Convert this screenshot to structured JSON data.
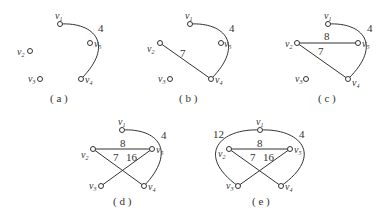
{
  "panels": [
    {
      "caption": "( a )",
      "nodes": {
        "v1": [
          60,
          24
        ],
        "v2": [
          30,
          51
        ],
        "v3": [
          40,
          79
        ],
        "v4": [
          81,
          79
        ],
        "v5": [
          90,
          43
        ]
      },
      "edges": [
        {
          "from": "v1",
          "to": "v4",
          "weight": "4",
          "curved": true
        }
      ]
    },
    {
      "caption": "( b )",
      "nodes": {
        "v1": [
          190,
          24
        ],
        "v2": [
          160,
          43
        ],
        "v3": [
          170,
          79
        ],
        "v4": [
          211,
          79
        ],
        "v5": [
          221,
          43
        ]
      },
      "edges": [
        {
          "from": "v1",
          "to": "v4",
          "weight": "4",
          "curved": true
        },
        {
          "from": "v2",
          "to": "v4",
          "weight": "7"
        }
      ]
    },
    {
      "caption": "( c )",
      "nodes": {
        "v1": [
          328,
          24
        ],
        "v2": [
          297,
          43
        ],
        "v3": [
          306,
          79
        ],
        "v4": [
          348,
          79
        ],
        "v5": [
          358,
          43
        ]
      },
      "edges": [
        {
          "from": "v1",
          "to": "v4",
          "weight": "4",
          "curved": true
        },
        {
          "from": "v2",
          "to": "v4",
          "weight": "7"
        },
        {
          "from": "v2",
          "to": "v5",
          "weight": "8"
        }
      ]
    },
    {
      "caption": "( d )",
      "nodes": {
        "v1": [
          122,
          130
        ],
        "v2": [
          93,
          149
        ],
        "v3": [
          101,
          186
        ],
        "v4": [
          144,
          186
        ],
        "v5": [
          152,
          149
        ]
      },
      "edges": [
        {
          "from": "v1",
          "to": "v4",
          "weight": "4",
          "curved": true
        },
        {
          "from": "v2",
          "to": "v4",
          "weight": "7"
        },
        {
          "from": "v2",
          "to": "v5",
          "weight": "8"
        },
        {
          "from": "v5",
          "to": "v3",
          "weight": "16"
        }
      ]
    },
    {
      "caption": "( e )",
      "nodes": {
        "v1": [
          260,
          130
        ],
        "v2": [
          229,
          149
        ],
        "v3": [
          238,
          186
        ],
        "v4": [
          281,
          186
        ],
        "v5": [
          290,
          149
        ]
      },
      "edges": [
        {
          "from": "v1",
          "to": "v4",
          "weight": "4",
          "curved": true
        },
        {
          "from": "v2",
          "to": "v4",
          "weight": "7"
        },
        {
          "from": "v2",
          "to": "v5",
          "weight": "8"
        },
        {
          "from": "v5",
          "to": "v3",
          "weight": "16"
        },
        {
          "from": "v1",
          "to": "v3",
          "weight": "12",
          "curved": true
        }
      ]
    }
  ],
  "labels": {
    "v1": "v",
    "v1_sub": "1",
    "v2": "v",
    "v2_sub": "2",
    "v3": "v",
    "v3_sub": "3",
    "v4": "v",
    "v4_sub": "4",
    "v5": "v",
    "v5_sub": "5",
    "w4": "4",
    "w7": "7",
    "w8": "8",
    "w16": "16",
    "w12": "12"
  }
}
